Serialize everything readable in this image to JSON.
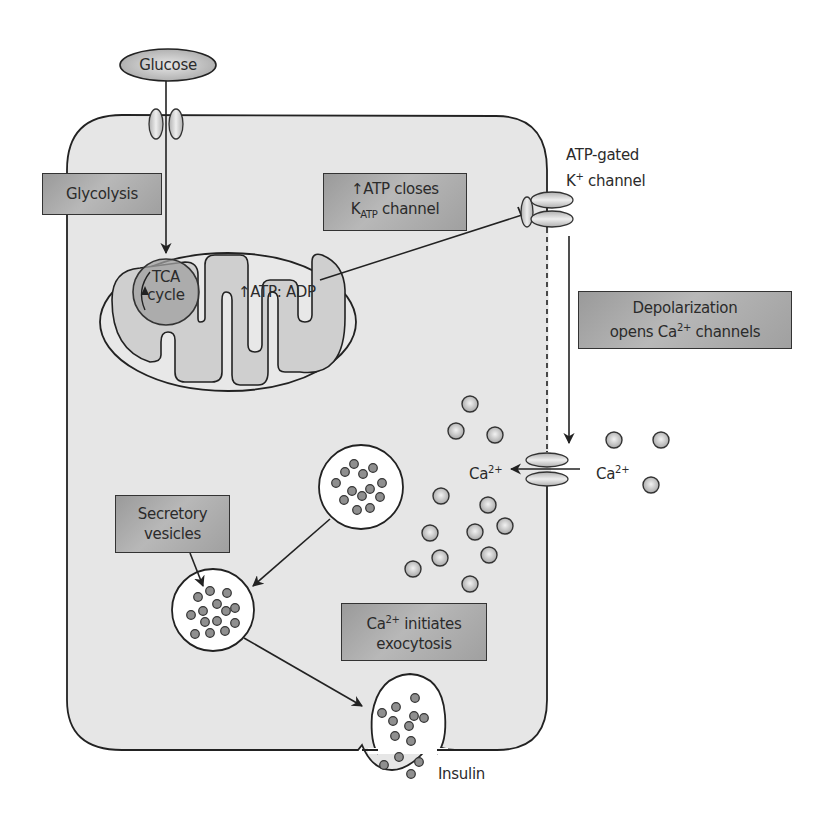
{
  "diagram": {
    "nodes": {
      "glucose": "Glucose",
      "glycolysis": "Glycolysis",
      "tca_line1": "TCA",
      "tca_line2": "cycle",
      "atp_adp": "↑ATP: ADP",
      "atp_closes_line1": "↑ATP closes",
      "katp_k": "K",
      "katp_sub": "ATP",
      "katp_rest": " channel",
      "k_channel_line1": "ATP-gated",
      "k_channel_k": "K",
      "k_channel_sup": "+",
      "k_channel_rest": " channel",
      "depol_line1": "Depolarization",
      "depol_line2_a": "opens Ca",
      "depol_sup": "2+",
      "depol_line2_b": " channels",
      "ca_inside": "Ca",
      "ca_inside_sup": "2+",
      "ca_outside": "Ca",
      "ca_outside_sup": "2+",
      "secretory_line1": "Secretory",
      "secretory_line2": "vesicles",
      "ca_init_a": "Ca",
      "ca_init_sup": "2+",
      "ca_init_b": " initiates",
      "ca_init_line2": "exocytosis",
      "insulin": "Insulin"
    },
    "colors": {
      "cell_fill": "#e6e6e6",
      "stroke": "#222222",
      "box_fill": "#a8a8a8",
      "granule_fill": "#8f8f8f",
      "ion_fill": "#c8c8c8",
      "mito_inner_fill": "#cfcfcf",
      "tca_fill": "#9d9d9d"
    }
  }
}
